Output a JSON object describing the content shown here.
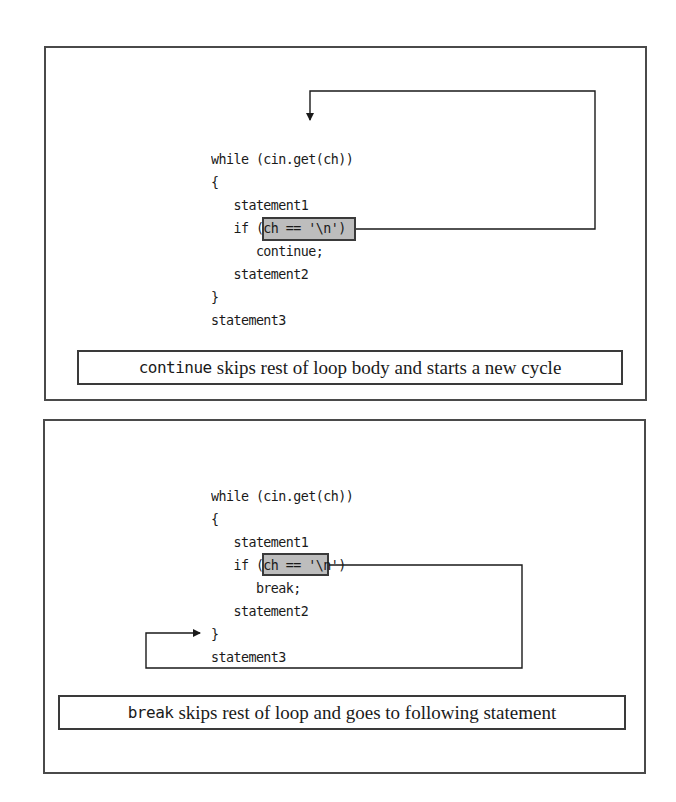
{
  "continue_diagram": {
    "code_lines": [
      "while (cin.get(ch))",
      "{",
      "   statement1",
      "   if (ch == '\\n')",
      "      continue;",
      "   statement2",
      "}",
      "statement3"
    ],
    "highlight_keyword": "continue;",
    "caption_keyword": "continue",
    "caption_text": "skips rest of loop body and starts a new cycle",
    "arrow_target": "while (cin.get(ch))"
  },
  "break_diagram": {
    "code_lines": [
      "while (cin.get(ch))",
      "{",
      "   statement1",
      "   if (ch == '\\n')",
      "      break;",
      "   statement2",
      "}",
      "statement3"
    ],
    "highlight_keyword": "break;",
    "caption_keyword": "break",
    "caption_text": "skips rest of loop and goes to following statement",
    "arrow_target": "statement3"
  },
  "colors": {
    "border": "#4a4a4a",
    "highlight_fill": "#bdbdbd",
    "text": "#1a1a1a"
  }
}
